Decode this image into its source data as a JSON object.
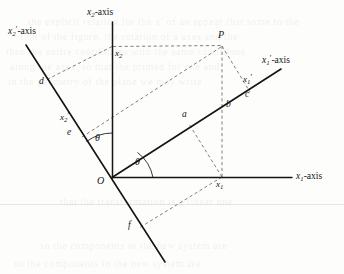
{
  "figure": {
    "background_color": "#fdfdfc",
    "line_color": "#141414",
    "dash_color": "#5a5a5a"
  },
  "axes": [
    {
      "id": "x2",
      "label_main": "x",
      "label_sub": "2",
      "label_prime": "",
      "label_suffix": "-axis",
      "full_text": "x2-axis"
    },
    {
      "id": "x1",
      "label_main": "x",
      "label_sub": "1",
      "label_prime": "",
      "label_suffix": "-axis",
      "full_text": "x1-axis"
    },
    {
      "id": "x1p",
      "label_main": "x",
      "label_sub": "1",
      "label_prime": "′",
      "label_suffix": "-axis",
      "full_text": "x1'-axis"
    },
    {
      "id": "x2p",
      "label_main": "x",
      "label_sub": "2",
      "label_prime": "′",
      "label_suffix": "-axis",
      "full_text": "x2'-axis"
    }
  ],
  "points": [
    {
      "id": "origin",
      "label": "O"
    },
    {
      "id": "P",
      "label": "P"
    }
  ],
  "coordinate_labels": [
    {
      "id": "x2-coord",
      "main": "x",
      "sub": "2",
      "prime": ""
    },
    {
      "id": "x1-coord",
      "main": "x",
      "sub": "1",
      "prime": ""
    },
    {
      "id": "x1p-coord",
      "main": "x",
      "sub": "1",
      "prime": "′"
    },
    {
      "id": "x2p-coord",
      "main": "x",
      "sub": "2",
      "prime": "′"
    }
  ],
  "segment_labels": [
    {
      "id": "a",
      "label": "a"
    },
    {
      "id": "b",
      "label": "b"
    },
    {
      "id": "c",
      "label": "c"
    },
    {
      "id": "d",
      "label": "d"
    },
    {
      "id": "e",
      "label": "e"
    },
    {
      "id": "f",
      "label": "f"
    }
  ],
  "angles": [
    {
      "id": "theta-lower",
      "label": "θ"
    },
    {
      "id": "theta-upper",
      "label": "θ"
    }
  ],
  "bleed_text": [
    {
      "id": "bleed-1",
      "text": "the explicit relation for the x′ of an appear that some to the"
    },
    {
      "id": "bleed-2",
      "text": "tion of the figure, the rotation of a axes and the"
    },
    {
      "id": "bleed-3",
      "text": "then the entire coordinates with the same conditions"
    },
    {
      "id": "bleed-4",
      "text": "along the axes, so that the primed for one and"
    },
    {
      "id": "bleed-5",
      "text": "in the geometry of the plane we may write"
    },
    {
      "id": "bleed-6",
      "text": "that the transformation is a linear one"
    },
    {
      "id": "bleed-7",
      "text": "so the components in the new system are"
    }
  ]
}
